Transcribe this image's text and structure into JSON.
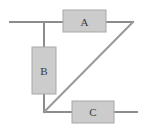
{
  "figure": {
    "width": 146,
    "height": 133,
    "background_color": "#ffffff"
  },
  "style": {
    "wire_color": "#8c8c8c",
    "wire_width": 2,
    "diagonal_color": "#9a9a9a",
    "box_fill": "#cccccc",
    "box_stroke": "#a8a8a8",
    "box_stroke_width": 1,
    "label_color": "#3a3a3a",
    "label_font_size": 11
  },
  "components": [
    {
      "id": "component-a",
      "label": "A",
      "orientation": "horizontal",
      "x": 63,
      "y": 10,
      "width": 43,
      "height": 22,
      "label_x": 84.5,
      "label_y": 21.5
    },
    {
      "id": "component-b",
      "label": "B",
      "orientation": "vertical",
      "x": 32,
      "y": 47,
      "width": 24,
      "height": 47,
      "label_x": 44,
      "label_y": 70.5
    },
    {
      "id": "component-c",
      "label": "C",
      "orientation": "horizontal",
      "x": 72,
      "y": 101,
      "width": 42,
      "height": 22,
      "label_x": 93,
      "label_y": 112
    }
  ],
  "wires": [
    {
      "id": "wire-top-left",
      "x1": 10,
      "y1": 22,
      "x2": 63,
      "y2": 22
    },
    {
      "id": "wire-top-right",
      "x1": 106,
      "y1": 22,
      "x2": 133,
      "y2": 22
    },
    {
      "id": "wire-left-upper",
      "x1": 44,
      "y1": 22,
      "x2": 44,
      "y2": 47
    },
    {
      "id": "wire-left-lower",
      "x1": 44,
      "y1": 94,
      "x2": 44,
      "y2": 112
    },
    {
      "id": "wire-bottom-left",
      "x1": 44,
      "y1": 112,
      "x2": 72,
      "y2": 112
    },
    {
      "id": "wire-bottom-right",
      "x1": 114,
      "y1": 112,
      "x2": 137,
      "y2": 112
    }
  ],
  "diagonal": {
    "id": "wire-diagonal",
    "x1": 133,
    "y1": 22,
    "x2": 44,
    "y2": 112
  },
  "junctions": [
    {
      "id": "junction-top-left",
      "x": 44,
      "y": 22
    },
    {
      "id": "junction-bottom-left",
      "x": 44,
      "y": 112
    },
    {
      "id": "junction-top-right",
      "x": 133,
      "y": 22
    }
  ]
}
